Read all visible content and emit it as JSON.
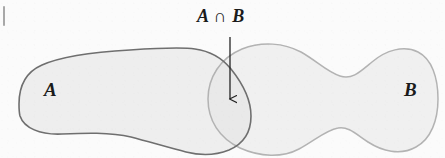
{
  "figure": {
    "type": "venn-diagram",
    "width": 445,
    "height": 158,
    "background_color": "#fbfbfb"
  },
  "labels": {
    "set_a": "A",
    "set_b": "B",
    "intersection": "A ∩ B"
  },
  "annotation": {
    "arrow": {
      "name": "intersection-pointer-arrow",
      "direction": "down",
      "x": 230,
      "y_start": 37,
      "y_end": 101,
      "color": "#242424"
    }
  },
  "colors": {
    "set_a_fill": "#eeeeee",
    "set_a_stroke": "#6f6f6f",
    "set_b_fill": "#f0f0f0",
    "set_b_stroke": "#b3b3b3",
    "intersection_fill": "#e9e9e9",
    "label_color": "#1b1b1b",
    "page_edge_mark": "#8c8c8c"
  },
  "geometry": {
    "set_a": {
      "name": "set-a-blob",
      "bounds": [
        18,
        46,
        252,
        153
      ],
      "path": "M 19 104 C 19 86 26 72 42 65 C 62 56 96 52 130 50 C 160 48 182 47 195 49 C 210 51 222 58 231 69 C 243 84 251 101 251 116 C 251 132 243 144 229 150 C 214 156 198 155 186 152 C 170 148 150 142 131 137 C 110 132 84 133 62 134 C 40 135 24 128 20 116 C 19 112 19 108 19 104 Z"
    },
    "set_b": {
      "name": "set-b-blob",
      "bounds": [
        207,
        43,
        439,
        156
      ],
      "path": "M 208 99 C 208 78 220 58 242 49 C 262 41 284 43 301 52 C 317 61 327 72 340 76 C 352 80 360 72 372 62 C 386 50 404 45 418 52 C 432 59 438 78 438 99 C 438 120 431 139 416 147 C 400 156 382 151 368 142 C 356 134 348 126 338 128 C 326 130 314 141 299 149 C 282 158 260 157 240 148 C 219 138 208 120 208 99 Z"
    },
    "intersection_lens": {
      "name": "intersection-lens",
      "bounds": [
        207,
        67,
        252,
        153
      ]
    }
  }
}
